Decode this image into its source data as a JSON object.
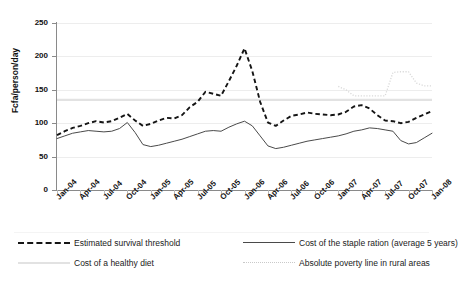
{
  "chart_data": {
    "type": "line",
    "title": "",
    "xlabel": "",
    "ylabel": "Fcfa/person/day",
    "ylim": [
      0,
      250
    ],
    "yticks": [
      0,
      50,
      100,
      150,
      200,
      250
    ],
    "grid": true,
    "legend_position": "bottom",
    "x": [
      "Jan-04",
      "Feb-04",
      "Mar-04",
      "Apr-04",
      "May-04",
      "Jun-04",
      "Jul-04",
      "Aug-04",
      "Sep-04",
      "Oct-04",
      "Nov-04",
      "Dec-04",
      "Jan-05",
      "Feb-05",
      "Mar-05",
      "Apr-05",
      "May-05",
      "Jun-05",
      "Jul-05",
      "Aug-05",
      "Sep-05",
      "Oct-05",
      "Nov-05",
      "Dec-05",
      "Jan-06",
      "Feb-06",
      "Mar-06",
      "Apr-06",
      "May-06",
      "Jun-06",
      "Jul-06",
      "Aug-06",
      "Sep-06",
      "Oct-06",
      "Nov-06",
      "Dec-06",
      "Jan-07",
      "Feb-07",
      "Mar-07",
      "Apr-07",
      "May-07",
      "Jun-07",
      "Jul-07",
      "Aug-07",
      "Sep-07",
      "Oct-07",
      "Nov-07",
      "Dec-07",
      "Jan-08"
    ],
    "xtick_labels": [
      "Jan-04",
      "Apr-04",
      "Jul-04",
      "Oct-04",
      "Jan-05",
      "Apr-05",
      "Jul-05",
      "Oct-05",
      "Jan-06",
      "Apr-06",
      "Jul-06",
      "Oct-06",
      "Jan-07",
      "Apr-07",
      "Jul-07",
      "Oct-07",
      "Jan-08"
    ],
    "series": [
      {
        "name": "Estimated survival threshold",
        "style": "dashed",
        "color": "#151515",
        "values": [
          82,
          88,
          93,
          96,
          100,
          103,
          101,
          103,
          108,
          114,
          104,
          96,
          99,
          104,
          108,
          107,
          112,
          124,
          132,
          147,
          144,
          141,
          163,
          186,
          212,
          178,
          132,
          101,
          96,
          104,
          111,
          113,
          116,
          114,
          113,
          112,
          113,
          117,
          125,
          127,
          122,
          112,
          104,
          103,
          100,
          102,
          108,
          113,
          118
        ]
      },
      {
        "name": "Cost of the staple ration (average 5 years)",
        "style": "solid",
        "color": "#4a4a4a",
        "values": [
          77,
          81,
          85,
          87,
          89,
          88,
          87,
          88,
          92,
          101,
          86,
          68,
          65,
          67,
          70,
          73,
          76,
          80,
          84,
          88,
          89,
          88,
          94,
          99,
          103,
          96,
          81,
          66,
          62,
          64,
          67,
          70,
          73,
          75,
          77,
          79,
          81,
          84,
          88,
          90,
          93,
          92,
          90,
          88,
          74,
          69,
          71,
          78,
          85
        ]
      },
      {
        "name": "Cost of a healthy diet",
        "style": "solid-gray",
        "color": "#e2e2e2",
        "constant": 135,
        "values": [
          135,
          135,
          135,
          135,
          135,
          135,
          135,
          135,
          135,
          135,
          135,
          135,
          135,
          135,
          135,
          135,
          135,
          135,
          135,
          135,
          135,
          135,
          135,
          135,
          135,
          135,
          135,
          135,
          135,
          135,
          135,
          135,
          135,
          135,
          135,
          135,
          135,
          135,
          135,
          135,
          135,
          135,
          135,
          135,
          135,
          135,
          135,
          135,
          135
        ]
      },
      {
        "name": "Absolute poverty line in rural areas",
        "style": "dotted",
        "color": "#d9d9d9",
        "values": [
          null,
          null,
          null,
          null,
          null,
          null,
          null,
          null,
          null,
          null,
          null,
          null,
          null,
          null,
          null,
          null,
          null,
          null,
          null,
          null,
          null,
          null,
          null,
          null,
          null,
          null,
          null,
          null,
          null,
          null,
          null,
          null,
          null,
          null,
          null,
          null,
          155,
          150,
          141,
          141,
          141,
          141,
          141,
          176,
          177,
          177,
          160,
          156,
          156
        ]
      }
    ],
    "legend": [
      {
        "label": "Estimated survival threshold",
        "style": "dashed",
        "color": "#151515"
      },
      {
        "label": "Cost of the staple ration (average 5 years)",
        "style": "solid",
        "color": "#4a4a4a"
      },
      {
        "label": "Cost of a healthy diet",
        "style": "solid-gray",
        "color": "#e2e2e2"
      },
      {
        "label": "Absolute poverty line in rural areas",
        "style": "dotted",
        "color": "#d9d9d9"
      }
    ]
  }
}
